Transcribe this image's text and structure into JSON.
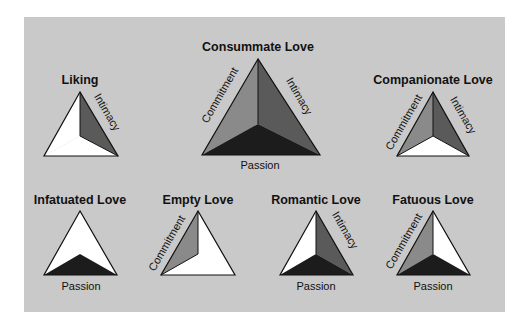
{
  "figure": {
    "panel_color": "#c9c9c9",
    "colors": {
      "commitment": "#8a8a8a",
      "intimacy": "#5a5a5a",
      "passion": "#1c1c1c",
      "absent": "#ffffff",
      "outline": "#111111"
    },
    "components": {
      "commitment": "Commitment",
      "intimacy": "Intimacy",
      "passion": "Passion"
    },
    "triangles": [
      {
        "id": "liking",
        "title": "Liking",
        "intimacy": true,
        "passion": false,
        "commitment": false,
        "labels": {
          "intimacy": "Intimacy"
        }
      },
      {
        "id": "consummate",
        "title": "Consummate Love",
        "intimacy": true,
        "passion": true,
        "commitment": true,
        "labels": {
          "commitment": "Commitment",
          "intimacy": "Intimacy",
          "passion": "Passion"
        }
      },
      {
        "id": "companionate",
        "title": "Companionate Love",
        "intimacy": true,
        "passion": false,
        "commitment": true,
        "labels": {
          "commitment": "Commitment",
          "intimacy": "Intimacy"
        }
      },
      {
        "id": "infatuated",
        "title": "Infatuated Love",
        "intimacy": false,
        "passion": true,
        "commitment": false,
        "labels": {
          "passion": "Passion"
        }
      },
      {
        "id": "empty",
        "title": "Empty Love",
        "intimacy": false,
        "passion": false,
        "commitment": true,
        "labels": {
          "commitment": "Commitment"
        }
      },
      {
        "id": "romantic",
        "title": "Romantic Love",
        "intimacy": true,
        "passion": true,
        "commitment": false,
        "labels": {
          "intimacy": "Intimacy",
          "passion": "Passion"
        }
      },
      {
        "id": "fatuous",
        "title": "Fatuous Love",
        "intimacy": false,
        "passion": true,
        "commitment": true,
        "labels": {
          "commitment": "Commitment",
          "passion": "Passion"
        }
      }
    ]
  }
}
